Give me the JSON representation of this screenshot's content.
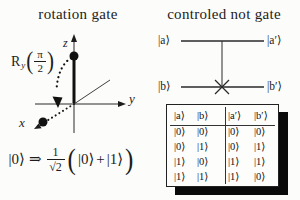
{
  "left_panel": {
    "title": "rotation gate",
    "gate": {
      "name": "R",
      "subscript": "y",
      "frac_numerator": "π",
      "frac_denominator": "2",
      "open_paren": "(",
      "close_paren": ")"
    },
    "axes": {
      "x_label": "x",
      "y_label": "y",
      "z_label": "z"
    },
    "equation": {
      "input_ket": "|0⟩",
      "implies": "⇒",
      "frac_numerator": "1",
      "frac_den_root": "√",
      "frac_den_value": "2",
      "open_paren": "(",
      "term_a": "|0⟩",
      "plus": "+",
      "term_b": "|1⟩",
      "close_paren": ")"
    }
  },
  "right_panel": {
    "title": "controled not gate",
    "circuit": {
      "control_in": "|a⟩",
      "control_out": "|a′⟩",
      "target_in": "|b⟩",
      "target_out": "|b′⟩"
    },
    "truth_table": {
      "headers": [
        "|a⟩",
        "|b⟩",
        "|a′⟩",
        "|b′⟩"
      ],
      "rows": [
        [
          "|0⟩",
          "|0⟩",
          "|0⟩",
          "|0⟩"
        ],
        [
          "|0⟩",
          "|1⟩",
          "|0⟩",
          "|1⟩"
        ],
        [
          "|1⟩",
          "|0⟩",
          "|1⟩",
          "|1⟩"
        ],
        [
          "|1⟩",
          "|1⟩",
          "|1⟩",
          "|0⟩"
        ]
      ]
    }
  },
  "colors": {
    "ink": "#1c1c1c",
    "shadow": "#0a0a0a",
    "background": "#fcfcfa"
  }
}
